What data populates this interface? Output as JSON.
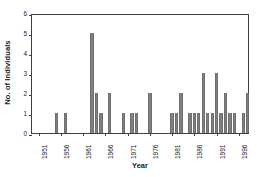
{
  "chart_data": {
    "type": "bar",
    "title": "",
    "xlabel": "Year",
    "ylabel": "No. of Individuals",
    "xlim": [
      1950,
      1999
    ],
    "ylim": [
      0,
      6
    ],
    "yticks": [
      0,
      1,
      2,
      3,
      4,
      5,
      6
    ],
    "xticks": [
      1951,
      1956,
      1961,
      1966,
      1971,
      1976,
      1981,
      1986,
      1991,
      1996
    ],
    "xtick_labels": [
      "1951",
      "1956",
      "1961",
      "1966",
      "1971",
      "1976",
      "1981",
      "1986",
      "1991",
      "1996"
    ],
    "grid": false,
    "legend": null,
    "bar_color": "#808080",
    "axis_color": "#3f3f3f",
    "categories": [
      1951,
      1952,
      1953,
      1954,
      1955,
      1956,
      1957,
      1958,
      1959,
      1960,
      1961,
      1962,
      1963,
      1964,
      1965,
      1966,
      1967,
      1968,
      1969,
      1970,
      1971,
      1972,
      1973,
      1974,
      1975,
      1976,
      1977,
      1978,
      1979,
      1980,
      1981,
      1982,
      1983,
      1984,
      1985,
      1986,
      1987,
      1988,
      1989,
      1990,
      1991,
      1992,
      1993,
      1994,
      1995,
      1996,
      1997,
      1998
    ],
    "values": [
      0,
      0,
      0,
      0,
      1,
      0,
      1,
      0,
      0,
      0,
      0,
      0,
      5,
      2,
      1,
      0,
      2,
      0,
      0,
      1,
      0,
      1,
      1,
      0,
      0,
      2,
      0,
      0,
      0,
      0,
      1,
      1,
      2,
      0,
      1,
      1,
      1,
      3,
      1,
      1,
      3,
      1,
      2,
      1,
      1,
      0,
      1,
      2
    ]
  }
}
